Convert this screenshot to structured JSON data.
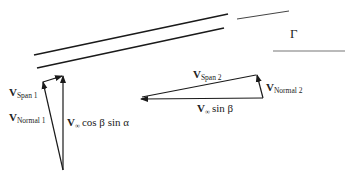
{
  "diagram": {
    "gamma_label": "Γ",
    "triangle1": {
      "v_span": {
        "main": "V",
        "sub": "Span 1"
      },
      "v_normal": {
        "main": "V",
        "sub": "Normal 1"
      },
      "component": {
        "main": "V",
        "sub": "∞",
        "rest": "cos β sin α"
      }
    },
    "triangle2": {
      "v_span": {
        "main": "V",
        "sub": "Span 2"
      },
      "v_normal": {
        "main": "V",
        "sub": "Normal 2"
      },
      "component": {
        "main": "V",
        "sub": "∞",
        "rest": "sin β"
      }
    },
    "colors": {
      "line": "#1a1a1a",
      "text": "#222222"
    }
  }
}
